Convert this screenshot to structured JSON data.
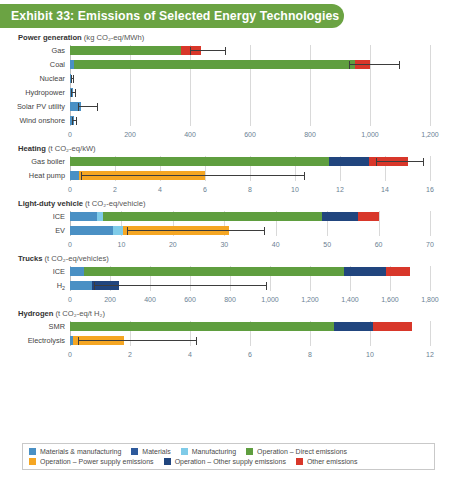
{
  "header": {
    "title": "Exhibit 33: Emissions of Selected Energy Technologies",
    "background": "#6ba343",
    "text_color": "#ffffff"
  },
  "colors": {
    "materials_manufacturing": "#4a90c4",
    "materials": "#2e5a9c",
    "manufacturing": "#7fcbe8",
    "operation_direct": "#5f9e3f",
    "operation_power_supply": "#f5a623",
    "operation_other_supply": "#21457e",
    "other_emissions": "#d8372a",
    "gridline": "#d9d9d9",
    "error_bar": "#3d3d3d",
    "tick_label": "#6b7f93"
  },
  "legend": {
    "rows": [
      [
        {
          "label": "Materials & manufacturing",
          "color": "#4a90c4"
        },
        {
          "label": "Materials",
          "color": "#2e5a9c"
        },
        {
          "label": "Manufacturing",
          "color": "#7fcbe8"
        },
        {
          "label": "Operation – Direct emissions",
          "color": "#5f9e3f"
        }
      ],
      [
        {
          "label": "Operation – Power supply emissions",
          "color": "#f5a623"
        },
        {
          "label": "Operation – Other supply emissions",
          "color": "#21457e"
        },
        {
          "label": "Other emissions",
          "color": "#d8372a"
        }
      ]
    ]
  },
  "chart_data": [
    {
      "type": "bar",
      "orientation": "horizontal",
      "stacked": true,
      "title": "Power generation",
      "unit": "(kg CO₂-eq/MWh)",
      "xlabel": "kg CO2-eq/MWh",
      "ylabel": "",
      "xlim": [
        0,
        1200
      ],
      "ticks": [
        0,
        200,
        400,
        600,
        800,
        1000,
        1200
      ],
      "tick_labels": [
        "0",
        "200",
        "400",
        "600",
        "800",
        "1,000",
        "1,200"
      ],
      "grid": true,
      "legend_position": "bottom",
      "categories": [
        "Gas",
        "Coal",
        "Nuclear",
        "Hydropower",
        "Solar PV utility",
        "Wind onshore"
      ],
      "series": [
        {
          "name": "Materials & manufacturing",
          "color": "#4a90c4",
          "values": [
            0,
            14,
            5,
            10,
            35,
            12
          ]
        },
        {
          "name": "Operation – Direct emissions",
          "color": "#5f9e3f",
          "values": [
            370,
            936,
            0,
            0,
            0,
            0
          ]
        },
        {
          "name": "Other emissions",
          "color": "#d8372a",
          "values": [
            65,
            50,
            0,
            0,
            0,
            0
          ]
        }
      ],
      "totals": [
        435,
        1000,
        5,
        10,
        35,
        12
      ],
      "error_bars": [
        {
          "category": "Gas",
          "low": 400,
          "high": 515
        },
        {
          "category": "Coal",
          "low": 930,
          "high": 1095
        },
        {
          "category": "Nuclear",
          "low": 3,
          "high": 9
        },
        {
          "category": "Hydropower",
          "low": 5,
          "high": 18
        },
        {
          "category": "Solar PV utility",
          "low": 25,
          "high": 90
        },
        {
          "category": "Wind onshore",
          "low": 8,
          "high": 20
        }
      ]
    },
    {
      "type": "bar",
      "orientation": "horizontal",
      "stacked": true,
      "title": "Heating",
      "unit": "(t CO₂-eq/kW)",
      "xlabel": "t CO2-eq/kW",
      "ylabel": "",
      "xlim": [
        0,
        16
      ],
      "ticks": [
        0,
        2,
        4,
        6,
        8,
        10,
        12,
        14,
        16
      ],
      "tick_labels": [
        "0",
        "2",
        "4",
        "6",
        "8",
        "10",
        "12",
        "14",
        "16"
      ],
      "grid": true,
      "categories": [
        "Gas boiler",
        "Heat pump"
      ],
      "series": [
        {
          "name": "Materials & manufacturing",
          "color": "#4a90c4",
          "values": [
            0,
            0.4
          ]
        },
        {
          "name": "Operation – Direct emissions",
          "color": "#5f9e3f",
          "values": [
            11.5,
            0
          ]
        },
        {
          "name": "Operation – Power supply emissions",
          "color": "#f5a623",
          "values": [
            0,
            5.6
          ]
        },
        {
          "name": "Operation – Other supply emissions",
          "color": "#21457e",
          "values": [
            1.8,
            0
          ]
        },
        {
          "name": "Other emissions",
          "color": "#d8372a",
          "values": [
            1.7,
            0
          ]
        }
      ],
      "totals": [
        15.0,
        6.0
      ],
      "error_bars": [
        {
          "category": "Gas boiler",
          "low": 13.6,
          "high": 15.7
        },
        {
          "category": "Heat pump",
          "low": 0.5,
          "high": 10.4
        }
      ]
    },
    {
      "type": "bar",
      "orientation": "horizontal",
      "stacked": true,
      "title": "Light-duty vehicle",
      "unit": "(t CO₂-eq/vehicle)",
      "xlabel": "t CO2-eq/vehicle",
      "ylabel": "",
      "xlim": [
        0,
        70
      ],
      "ticks": [
        0,
        10,
        20,
        30,
        40,
        50,
        60,
        70
      ],
      "tick_labels": [
        "0",
        "10",
        "20",
        "30",
        "40",
        "50",
        "60",
        "70"
      ],
      "grid": true,
      "categories": [
        "ICE",
        "EV"
      ],
      "series": [
        {
          "name": "Materials & manufacturing",
          "color": "#4a90c4",
          "values": [
            5.3,
            8.3
          ]
        },
        {
          "name": "Manufacturing",
          "color": "#7fcbe8",
          "values": [
            1.2,
            2.0
          ]
        },
        {
          "name": "Operation – Direct emissions",
          "color": "#5f9e3f",
          "values": [
            42.5,
            0
          ]
        },
        {
          "name": "Operation – Power supply emissions",
          "color": "#f5a623",
          "values": [
            0,
            20.7
          ]
        },
        {
          "name": "Operation – Other supply emissions",
          "color": "#21457e",
          "values": [
            7.0,
            0
          ]
        },
        {
          "name": "Other emissions",
          "color": "#d8372a",
          "values": [
            4.0,
            0
          ]
        }
      ],
      "totals": [
        60.0,
        31.0
      ],
      "error_bars": [
        {
          "category": "EV",
          "low": 11.0,
          "high": 37.8
        }
      ]
    },
    {
      "type": "bar",
      "orientation": "horizontal",
      "stacked": true,
      "title": "Trucks",
      "unit": "(t CO₂-eq/vehicles)",
      "xlabel": "t CO2-eq/vehicles",
      "ylabel": "",
      "xlim": [
        0,
        1800
      ],
      "ticks": [
        0,
        200,
        400,
        600,
        800,
        1000,
        1200,
        1400,
        1600,
        1800
      ],
      "tick_labels": [
        "0",
        "200",
        "400",
        "600",
        "800",
        "1,000",
        "1,200",
        "1,400",
        "1,600",
        "1,800"
      ],
      "grid": true,
      "categories": [
        "ICE",
        "H₂"
      ],
      "series": [
        {
          "name": "Materials & manufacturing",
          "color": "#4a90c4",
          "values": [
            70,
            110
          ]
        },
        {
          "name": "Operation – Direct emissions",
          "color": "#5f9e3f",
          "values": [
            1300,
            0
          ]
        },
        {
          "name": "Operation – Other supply emissions",
          "color": "#21457e",
          "values": [
            210,
            135
          ]
        },
        {
          "name": "Other emissions",
          "color": "#d8372a",
          "values": [
            120,
            0
          ]
        }
      ],
      "totals": [
        1700,
        245
      ],
      "error_bars": [
        {
          "category": "H₂",
          "low": 120,
          "high": 980
        }
      ]
    },
    {
      "type": "bar",
      "orientation": "horizontal",
      "stacked": true,
      "title": "Hydrogen",
      "unit": "(t CO₂-eq/t H₂)",
      "xlabel": "t CO2-eq/t H2",
      "ylabel": "",
      "xlim": [
        0,
        12
      ],
      "ticks": [
        0,
        2,
        4,
        6,
        8,
        10,
        12
      ],
      "tick_labels": [
        "0",
        "2",
        "4",
        "6",
        "8",
        "10",
        "12"
      ],
      "grid": true,
      "categories": [
        "SMR",
        "Electrolysis"
      ],
      "series": [
        {
          "name": "Materials & manufacturing",
          "color": "#4a90c4",
          "values": [
            0,
            0.1
          ]
        },
        {
          "name": "Operation – Direct emissions",
          "color": "#5f9e3f",
          "values": [
            8.8,
            0
          ]
        },
        {
          "name": "Operation – Power supply emissions",
          "color": "#f5a623",
          "values": [
            0,
            1.7
          ]
        },
        {
          "name": "Operation – Other supply emissions",
          "color": "#21457e",
          "values": [
            1.3,
            0
          ]
        },
        {
          "name": "Other emissions",
          "color": "#d8372a",
          "values": [
            1.3,
            0
          ]
        }
      ],
      "totals": [
        11.4,
        1.8
      ],
      "error_bars": [
        {
          "category": "Electrolysis",
          "low": 0.25,
          "high": 4.2
        }
      ]
    }
  ]
}
